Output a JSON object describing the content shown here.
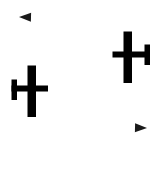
{
  "canvas": {
    "width": 165,
    "height": 177,
    "background_color": "#ffffff",
    "ink_color": "#000000"
  },
  "figure": {
    "element_count": 4
  },
  "aircraft": [
    {
      "id": "aircraft-upper-right",
      "label": "Upper right airplane",
      "orientation": "nose-up-tail-right",
      "color": "#000000",
      "fuselage": {
        "x": 123.5,
        "y": 31.5,
        "width": 8.5,
        "height": 51.5
      },
      "wing": {
        "x": 112.5,
        "y": 51.5,
        "width": 36.5,
        "height": 6.0
      },
      "tailfin": {
        "x": 144.5,
        "y": 44.5,
        "width": 5.5,
        "height": 20.5
      },
      "nose_tip": {
        "x": 127.5,
        "y": 31.5
      }
    },
    {
      "id": "aircraft-lower-left",
      "label": "Lower left airplane",
      "orientation": "nose-up-tail-left",
      "color": "#000000",
      "fuselage": {
        "x": 27.5,
        "y": 65.5,
        "width": 8.5,
        "height": 51.5
      },
      "wing": {
        "x": 11.5,
        "y": 85.5,
        "width": 36.5,
        "height": 6.0
      },
      "tailfin": {
        "x": 11.5,
        "y": 79.5,
        "width": 5.5,
        "height": 20.5
      },
      "nose_tip": {
        "x": 31.5,
        "y": 65.5
      }
    }
  ],
  "paths": [
    {
      "id": "path-upper-leftward",
      "label": "Upper curved flight path pointing left",
      "color": "#1a1a1a",
      "direction": "leftward",
      "start_point": {
        "x": 116,
        "y": 56
      },
      "end_point": {
        "x": 19,
        "y": 17
      },
      "control_point_1": {
        "x": 92,
        "y": 56
      },
      "control_point_2": {
        "x": 60,
        "y": 18
      },
      "stroke_width_start": 0.6,
      "stroke_width_end": 2.0,
      "arrow_length": 12,
      "arrow_half_width": 4.5
    },
    {
      "id": "path-lower-rightward",
      "label": "Lower curved flight path pointing right",
      "color": "#1a1a1a",
      "direction": "rightward",
      "start_point": {
        "x": 48,
        "y": 89
      },
      "end_point": {
        "x": 147,
        "y": 128
      },
      "control_point_1": {
        "x": 72,
        "y": 90
      },
      "control_point_2": {
        "x": 106,
        "y": 127
      },
      "stroke_width_start": 0.6,
      "stroke_width_end": 2.0,
      "arrow_length": 12,
      "arrow_half_width": 4.5
    }
  ]
}
